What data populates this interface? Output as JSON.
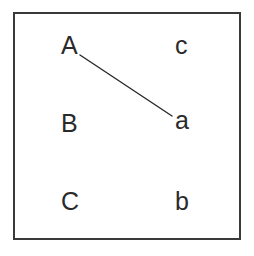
{
  "diagram": {
    "width": 254,
    "height": 256,
    "background_color": "#ffffff",
    "frame": {
      "border_color": "#3a3a3c",
      "border_width": 2,
      "x": 13,
      "y": 12,
      "width": 228,
      "height": 228
    },
    "text_color": "#2a2a2a",
    "left_column": [
      {
        "label": "A",
        "x": 61,
        "y": 33
      },
      {
        "label": "B",
        "x": 61,
        "y": 111
      },
      {
        "label": "C",
        "x": 61,
        "y": 189
      }
    ],
    "right_column": [
      {
        "label": "c",
        "x": 175,
        "y": 33
      },
      {
        "label": "a",
        "x": 175,
        "y": 108
      },
      {
        "label": "b",
        "x": 175,
        "y": 189
      }
    ],
    "edges": [
      {
        "from": "A",
        "to": "a",
        "x1": 80,
        "y1": 55,
        "x2": 172,
        "y2": 116,
        "color": "#2a2a2a",
        "width": 1.4
      }
    ]
  }
}
